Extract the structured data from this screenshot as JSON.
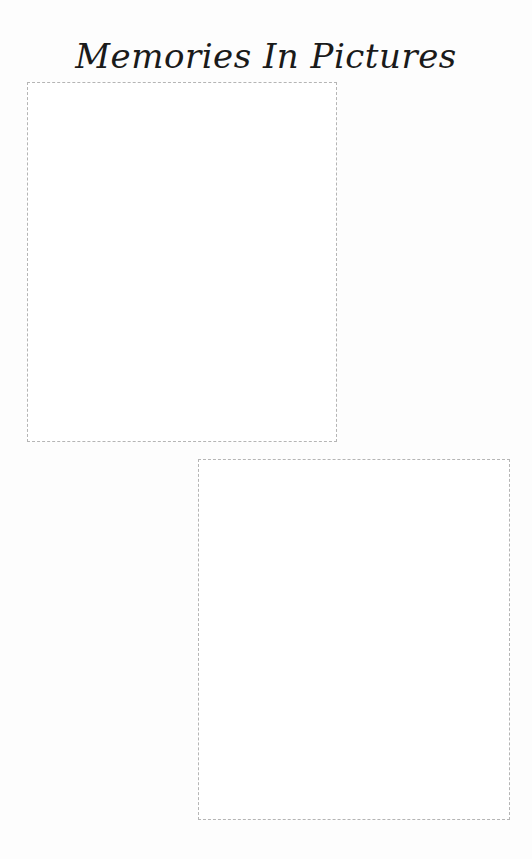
{
  "page": {
    "title": "Memories In Pictures"
  },
  "photo_frames": [
    {
      "label": "",
      "content": "empty"
    },
    {
      "label": "",
      "content": "empty"
    }
  ]
}
